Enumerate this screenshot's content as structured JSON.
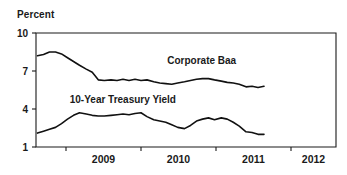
{
  "chart_data": {
    "type": "line",
    "title": "",
    "ylabel": "Percent",
    "xlabel": "",
    "ylim": [
      1,
      10
    ],
    "xlim": [
      2008.6,
      2012.6
    ],
    "grid": false,
    "legend_position": "inline-annotation",
    "y_ticks": [
      "10",
      "7",
      "4",
      "1"
    ],
    "y_tick_values": [
      10,
      7,
      4,
      1
    ],
    "x_ticks": [
      "2009",
      "2010",
      "2011",
      "2012"
    ],
    "x_tick_values": [
      2009,
      2010,
      2011,
      2012
    ],
    "annotations": [
      {
        "text": "Corporate Baa",
        "x": 2010.35,
        "y": 7.55
      },
      {
        "text": "10-Year Treasury Yield",
        "x": 2009.05,
        "y": 4.45
      }
    ],
    "series": [
      {
        "name": "Corporate Baa",
        "color": "#111111",
        "x": [
          2008.62,
          2008.7,
          2008.78,
          2008.86,
          2008.94,
          2009.02,
          2009.1,
          2009.18,
          2009.27,
          2009.35,
          2009.43,
          2009.51,
          2009.6,
          2009.68,
          2009.76,
          2009.84,
          2009.92,
          2010.0,
          2010.08,
          2010.17,
          2010.25,
          2010.33,
          2010.41,
          2010.49,
          2010.58,
          2010.66,
          2010.74,
          2010.82,
          2010.9,
          2010.98,
          2011.07,
          2011.15,
          2011.23,
          2011.31,
          2011.4,
          2011.48,
          2011.56,
          2011.64
        ],
        "values": [
          8.2,
          8.3,
          8.5,
          8.5,
          8.35,
          8.05,
          7.75,
          7.45,
          7.15,
          6.9,
          6.3,
          6.25,
          6.3,
          6.25,
          6.35,
          6.25,
          6.35,
          6.25,
          6.3,
          6.15,
          6.05,
          6.0,
          5.95,
          6.05,
          6.15,
          6.25,
          6.35,
          6.4,
          6.4,
          6.3,
          6.2,
          6.1,
          6.05,
          5.95,
          5.75,
          5.8,
          5.7,
          5.8
        ]
      },
      {
        "name": "10-Year Treasury Yield",
        "color": "#111111",
        "x": [
          2008.62,
          2008.7,
          2008.78,
          2008.86,
          2008.94,
          2009.02,
          2009.1,
          2009.18,
          2009.27,
          2009.35,
          2009.43,
          2009.51,
          2009.6,
          2009.68,
          2009.76,
          2009.84,
          2009.92,
          2010.0,
          2010.08,
          2010.17,
          2010.25,
          2010.33,
          2010.41,
          2010.49,
          2010.58,
          2010.66,
          2010.74,
          2010.82,
          2010.9,
          2010.98,
          2011.07,
          2011.15,
          2011.23,
          2011.31,
          2011.4,
          2011.48,
          2011.56,
          2011.64
        ],
        "values": [
          2.1,
          2.25,
          2.4,
          2.55,
          2.85,
          3.2,
          3.5,
          3.7,
          3.6,
          3.5,
          3.45,
          3.45,
          3.5,
          3.55,
          3.6,
          3.55,
          3.65,
          3.7,
          3.4,
          3.15,
          3.05,
          2.95,
          2.75,
          2.55,
          2.45,
          2.7,
          3.05,
          3.2,
          3.3,
          3.15,
          3.3,
          3.2,
          2.95,
          2.65,
          2.2,
          2.15,
          2.0,
          2.0
        ]
      }
    ]
  },
  "plot_geometry": {
    "left": 36,
    "right": 336,
    "top": 33,
    "bottom": 147
  }
}
